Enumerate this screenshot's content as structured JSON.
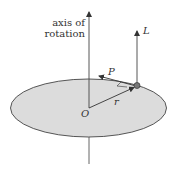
{
  "diagram": {
    "labels": {
      "axis_line1": "axis of",
      "axis_line2": "rotation",
      "angular_momentum": "L",
      "momentum": "P",
      "radius": "r",
      "origin": "O"
    },
    "colors": {
      "disk_fill": "#dcdcdc",
      "stroke": "#444444",
      "particle": "#777777"
    }
  }
}
